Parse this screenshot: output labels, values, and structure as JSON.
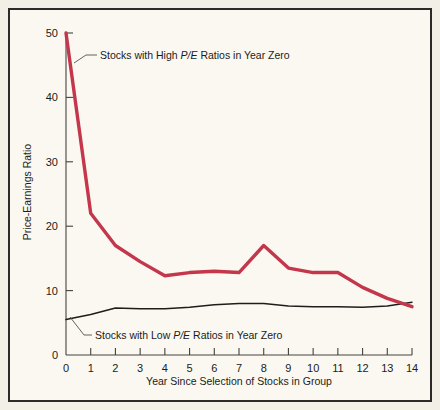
{
  "chart_data": {
    "type": "line",
    "title": "",
    "xlabel": "Year Since Selection of Stocks in Group",
    "ylabel": "Price-Earnings Ratio",
    "xlim": [
      0,
      14
    ],
    "ylim": [
      0,
      50
    ],
    "grid": false,
    "legend_position": "inline-annotations",
    "x": [
      0,
      1,
      2,
      3,
      4,
      5,
      6,
      7,
      8,
      9,
      10,
      11,
      12,
      13,
      14
    ],
    "xticklabels": [
      "0",
      "1",
      "2",
      "3",
      "4",
      "5",
      "6",
      "7",
      "8",
      "9",
      "10",
      "11",
      "12",
      "13",
      "14"
    ],
    "yticks": [
      0,
      10,
      20,
      30,
      40,
      50
    ],
    "yticklabels": [
      "0",
      "10",
      "20",
      "30",
      "40",
      "50"
    ],
    "series": [
      {
        "name": "Stocks with High P/E Ratios in Year Zero",
        "color": "#c4364b",
        "values": [
          50,
          22,
          17,
          14.5,
          12.3,
          12.8,
          13,
          12.8,
          17,
          13.5,
          12.8,
          12.8,
          10.5,
          8.8,
          7.5
        ]
      },
      {
        "name": "Stocks with Low P/E Ratios in Year Zero",
        "color": "#1f1d1b",
        "values": [
          5.5,
          6.3,
          7.3,
          7.2,
          7.2,
          7.4,
          7.8,
          8.0,
          8.0,
          7.6,
          7.5,
          7.5,
          7.4,
          7.6,
          8.2
        ]
      }
    ],
    "annotations": [
      {
        "name": "high-pe-annotation",
        "prefix": "Stocks with High ",
        "emphasis": "P/E",
        "suffix": " Ratios in Year Zero"
      },
      {
        "name": "low-pe-annotation",
        "prefix": "Stocks with Low ",
        "emphasis": "P/E",
        "suffix": " Ratios in Year Zero"
      }
    ]
  },
  "colors": {
    "high_pe_line": "#c4364b",
    "low_pe_line": "#1f1d1b",
    "axis": "#45423d",
    "frame": "#2b2a28",
    "background": "#faf8f1"
  }
}
